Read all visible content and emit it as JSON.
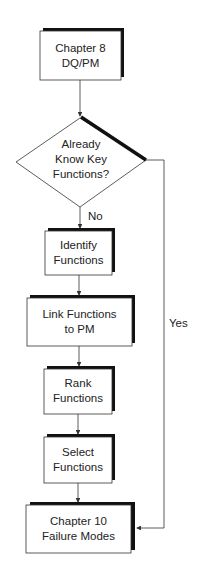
{
  "diagram": {
    "type": "flowchart",
    "nodes": [
      {
        "id": "start",
        "shape": "box",
        "lines": [
          "Chapter 8",
          "DQ/PM"
        ]
      },
      {
        "id": "decision",
        "shape": "diamond",
        "lines": [
          "Already",
          "Know Key",
          "Functions?"
        ]
      },
      {
        "id": "identify",
        "shape": "box",
        "lines": [
          "Identify",
          "Functions"
        ]
      },
      {
        "id": "link",
        "shape": "box",
        "lines": [
          "Link Functions",
          "to PM"
        ]
      },
      {
        "id": "rank",
        "shape": "box",
        "lines": [
          "Rank",
          "Functions"
        ]
      },
      {
        "id": "select",
        "shape": "box",
        "lines": [
          "Select",
          "Functions"
        ]
      },
      {
        "id": "end",
        "shape": "box",
        "lines": [
          "Chapter 10",
          "Failure Modes"
        ]
      }
    ],
    "edges": [
      {
        "from": "start",
        "to": "decision",
        "label": ""
      },
      {
        "from": "decision",
        "to": "identify",
        "label": "No"
      },
      {
        "from": "identify",
        "to": "link",
        "label": ""
      },
      {
        "from": "link",
        "to": "rank",
        "label": ""
      },
      {
        "from": "rank",
        "to": "select",
        "label": ""
      },
      {
        "from": "select",
        "to": "end",
        "label": ""
      },
      {
        "from": "decision",
        "to": "end",
        "label": "Yes"
      }
    ],
    "colors": {
      "stroke": "#333333",
      "shadow": "#111111",
      "text": "#222222"
    }
  }
}
